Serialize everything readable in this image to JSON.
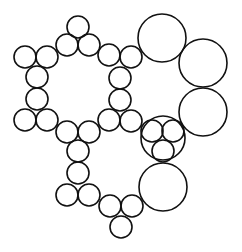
{
  "diagram": {
    "stroke_color": "#111111",
    "background": "#ffffff",
    "circles": [
      {
        "cx": 78,
        "cy": 27,
        "r": 11
      },
      {
        "cx": 67,
        "cy": 45,
        "r": 11
      },
      {
        "cx": 89,
        "cy": 45,
        "r": 11
      },
      {
        "cx": 25,
        "cy": 57,
        "r": 11
      },
      {
        "cx": 47,
        "cy": 57,
        "r": 11
      },
      {
        "cx": 37,
        "cy": 77,
        "r": 11
      },
      {
        "cx": 37,
        "cy": 99,
        "r": 11
      },
      {
        "cx": 25,
        "cy": 120,
        "r": 11
      },
      {
        "cx": 47,
        "cy": 120,
        "r": 11
      },
      {
        "cx": 67,
        "cy": 132,
        "r": 11
      },
      {
        "cx": 89,
        "cy": 132,
        "r": 11
      },
      {
        "cx": 78,
        "cy": 151,
        "r": 11
      },
      {
        "cx": 109,
        "cy": 55,
        "r": 11
      },
      {
        "cx": 131,
        "cy": 57,
        "r": 11
      },
      {
        "cx": 120,
        "cy": 78,
        "r": 11
      },
      {
        "cx": 120,
        "cy": 100,
        "r": 11
      },
      {
        "cx": 109,
        "cy": 120,
        "r": 11
      },
      {
        "cx": 131,
        "cy": 121,
        "r": 11
      },
      {
        "cx": 78,
        "cy": 173,
        "r": 11
      },
      {
        "cx": 67,
        "cy": 195,
        "r": 11
      },
      {
        "cx": 89,
        "cy": 195,
        "r": 11
      },
      {
        "cx": 110,
        "cy": 206,
        "r": 11
      },
      {
        "cx": 132,
        "cy": 206,
        "r": 11
      },
      {
        "cx": 121,
        "cy": 227,
        "r": 11
      },
      {
        "cx": 162,
        "cy": 38,
        "r": 24
      },
      {
        "cx": 203,
        "cy": 63,
        "r": 24
      },
      {
        "cx": 203,
        "cy": 112,
        "r": 24
      },
      {
        "cx": 163,
        "cy": 138,
        "r": 22
      },
      {
        "cx": 152,
        "cy": 131,
        "r": 11
      },
      {
        "cx": 173,
        "cy": 131,
        "r": 11
      },
      {
        "cx": 163,
        "cy": 151,
        "r": 11
      },
      {
        "cx": 163,
        "cy": 187,
        "r": 24
      }
    ]
  }
}
